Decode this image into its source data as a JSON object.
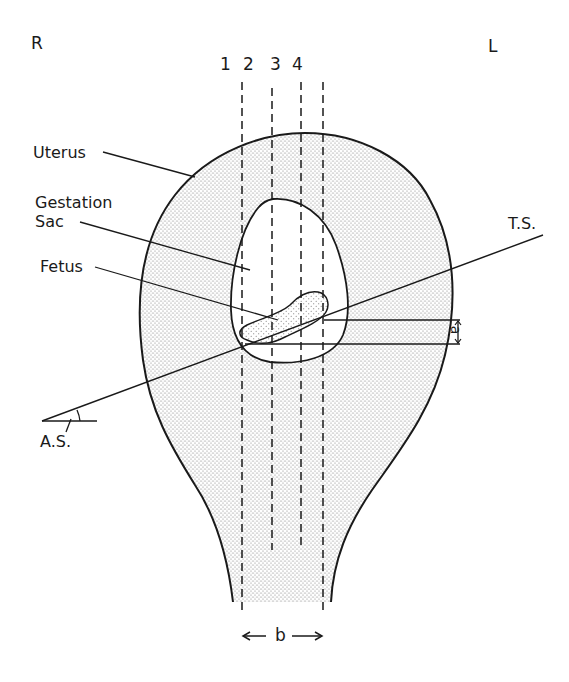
{
  "figure": {
    "orientation": {
      "right_label": "R",
      "left_label": "L"
    },
    "scan_planes": {
      "labels": [
        "1",
        "2",
        "3",
        "4"
      ]
    },
    "structures": {
      "uterus_label": "Uterus",
      "gestation_sac_label": "Gestation\nSac",
      "fetus_label": "Fetus"
    },
    "axes": {
      "transverse_section_label": "T.S.",
      "angle_label": "A.S."
    },
    "dimensions": {
      "a_label": "a",
      "b_label": "b"
    },
    "colors": {
      "ink": "#1a1a1a",
      "stipple": "#6e6e6e",
      "background": "#ffffff"
    }
  }
}
